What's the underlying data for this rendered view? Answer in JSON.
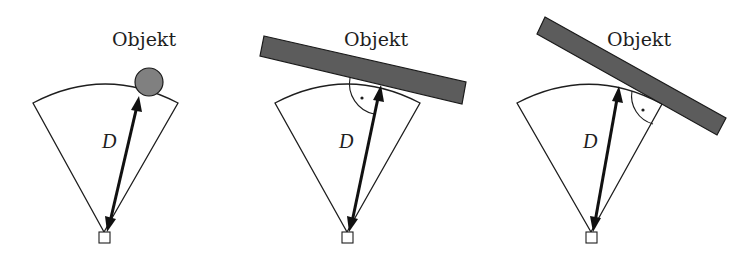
{
  "figure": {
    "panels": [
      {
        "id": "panel-1",
        "object_label": "Objekt",
        "object_shape": "circle",
        "distance_label": "D",
        "right_angle_marker": false
      },
      {
        "id": "panel-2",
        "object_label": "Objekt",
        "object_shape": "bar",
        "distance_label": "D",
        "right_angle_marker": true
      },
      {
        "id": "panel-3",
        "object_label": "Objekt",
        "object_shape": "bar",
        "distance_label": "D",
        "right_angle_marker": true
      }
    ],
    "colors": {
      "stroke": "#1e1e1e",
      "object_bar_fill": "#5c5c5c",
      "object_circle_fill": "#808080",
      "background": "#ffffff"
    }
  }
}
